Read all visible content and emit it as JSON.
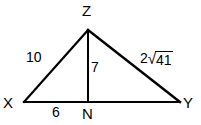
{
  "figure": {
    "kind": "geometry-triangle-diagram",
    "background_color": "#ffffff",
    "stroke_color": "#000000",
    "vertices": {
      "X": {
        "label": "X",
        "x": 24,
        "y": 102,
        "label_x": 3,
        "label_y": 95
      },
      "Y": {
        "label": "Y",
        "x": 180,
        "y": 102,
        "label_x": 183,
        "label_y": 95
      },
      "Z": {
        "label": "Z",
        "x": 88,
        "y": 30,
        "label_x": 82,
        "label_y": 3
      },
      "N": {
        "label": "N",
        "x": 88,
        "y": 102,
        "label_x": 82,
        "label_y": 106
      }
    },
    "segments": [
      {
        "name": "side-XZ",
        "from": "X",
        "to": "Z"
      },
      {
        "name": "side-ZY",
        "from": "Z",
        "to": "Y"
      },
      {
        "name": "base-XY",
        "from": "X",
        "to": "Y"
      },
      {
        "name": "altitude-ZN",
        "from": "Z",
        "to": "N"
      }
    ],
    "measures": {
      "side_xz": {
        "text": "10",
        "x": 26,
        "y": 50
      },
      "altitude_zn": {
        "text": "7",
        "x": 91,
        "y": 60
      },
      "segment_xn": {
        "text": "6",
        "x": 52,
        "y": 105
      },
      "side_zy": {
        "coefficient": "2",
        "radical_sign": "√",
        "radicand": "41",
        "text": "2√41",
        "x": 140,
        "y": 50
      }
    }
  }
}
